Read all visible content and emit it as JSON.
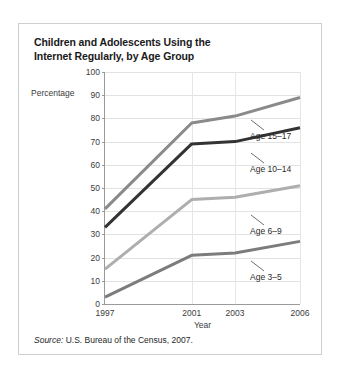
{
  "figure": {
    "title": "Children and Adolescents Using the Internet Regularly, by Age Group",
    "title_line_1": "Children and Adolescents Using the",
    "title_line_2": "Internet Regularly, by Age Group",
    "source_label": "Source:",
    "source_text": " U.S. Bureau of the Census, 2007."
  },
  "chart_data": {
    "type": "line",
    "title": "Children and Adolescents Using the Internet Regularly, by Age Group",
    "xlabel": "Year",
    "ylabel": "Percentage",
    "x": [
      1997,
      2001,
      2003,
      2006
    ],
    "categories": [
      "1997",
      "2001",
      "2003",
      "2006"
    ],
    "xlim": [
      1997,
      2006
    ],
    "ylim": [
      0,
      100
    ],
    "yticks": [
      0,
      10,
      20,
      30,
      40,
      50,
      60,
      70,
      80,
      90,
      100
    ],
    "ytick_labels": [
      "0",
      "10",
      "20",
      "30",
      "40",
      "50",
      "60",
      "70",
      "80",
      "90",
      "100"
    ],
    "xtick_labels": [
      "1997",
      "2001",
      "2003",
      "2006"
    ],
    "grid": true,
    "legend_position": "inline-annotations",
    "series": [
      {
        "name": "Age 15–17",
        "label": "Age 15–17",
        "color": "#8a8a8a",
        "values": [
          41,
          78,
          81,
          89
        ],
        "annotation_x": 231,
        "annotation_y": 107
      },
      {
        "name": "Age 10–14",
        "label": "Age 10–14",
        "color": "#333333",
        "values": [
          33,
          69,
          70,
          76
        ],
        "annotation_x": 231,
        "annotation_y": 140
      },
      {
        "name": "Age 6–9",
        "label": "Age 6–9",
        "color": "#aeaeae",
        "values": [
          15,
          45,
          46,
          51
        ],
        "annotation_x": 231,
        "annotation_y": 202
      },
      {
        "name": "Age 3–5",
        "label": "Age 3–5",
        "color": "#7c7c7c",
        "values": [
          3,
          21,
          22,
          27
        ],
        "annotation_x": 231,
        "annotation_y": 248
      }
    ]
  }
}
